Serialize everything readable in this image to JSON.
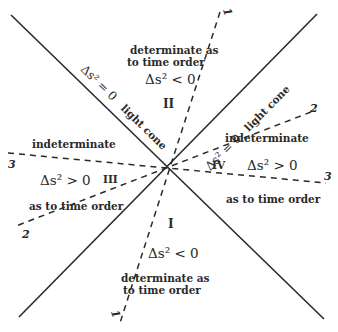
{
  "diagram": {
    "colors": {
      "ink": "#2a2a2a",
      "background": "#ffffff"
    },
    "light_cone": {
      "left_label_eq": "Δs² = 0",
      "left_label_tag": "light cone",
      "right_label_eq": "Δs² = 0",
      "right_label_tag": "light cone"
    },
    "dashed_lines": [
      {
        "id": "1",
        "label_top": "1",
        "label_bottom": "1"
      },
      {
        "id": "2",
        "label_top": "2",
        "label_bottom": "2"
      },
      {
        "id": "3",
        "label_left": "3",
        "label_right": "3"
      }
    ],
    "regions": {
      "II": {
        "numeral": "II",
        "line1": "determinate as",
        "line2": "to time order",
        "interval": "Δs² < 0"
      },
      "I": {
        "numeral": "I",
        "interval": "Δs² < 0",
        "line1": "determinate as",
        "line2": "to time order"
      },
      "III": {
        "numeral": "III",
        "top_text": "indeterminate",
        "interval": "Δs² > 0",
        "bottom_text": "as to time order"
      },
      "IV": {
        "numeral": "IV",
        "top_text": "indeterminate",
        "interval": "Δs² > 0",
        "bottom_text": "as to time order"
      }
    }
  }
}
